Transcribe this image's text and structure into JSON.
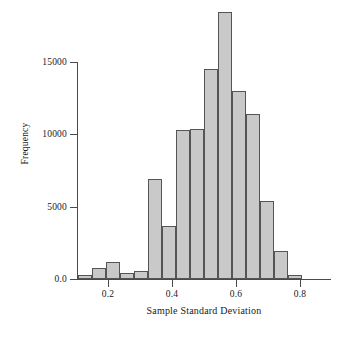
{
  "chart_data": {
    "type": "bar",
    "subtype": "histogram",
    "title": "",
    "xlabel": "Sample Standard Deviation",
    "ylabel": "Frequency",
    "xlim": [
      0.105,
      0.895
    ],
    "ylim": [
      0,
      18700
    ],
    "grid": false,
    "legend": null,
    "bin_width": 0.0439,
    "bar_fill_color": "#c9c9c9",
    "bar_edge_color": "#555555",
    "axis_color": "#4a4a4a",
    "x_ticks": [
      {
        "value": 0.2,
        "label": "0.2"
      },
      {
        "value": 0.4,
        "label": "0.4"
      },
      {
        "value": 0.6,
        "label": "0.6"
      },
      {
        "value": 0.8,
        "label": "0.8"
      }
    ],
    "y_ticks": [
      {
        "value": 0,
        "label": "0.0"
      },
      {
        "value": 5000,
        "label": "5000"
      },
      {
        "value": 10000,
        "label": "10000"
      },
      {
        "value": 15000,
        "label": "15000"
      }
    ],
    "bins": [
      {
        "x_left": 0.105,
        "x_right": 0.1489,
        "center": 0.127,
        "value": 300
      },
      {
        "x_left": 0.1489,
        "x_right": 0.1928,
        "center": 0.171,
        "value": 750
      },
      {
        "x_left": 0.1928,
        "x_right": 0.2367,
        "center": 0.215,
        "value": 1150
      },
      {
        "x_left": 0.2367,
        "x_right": 0.2806,
        "center": 0.259,
        "value": 400
      },
      {
        "x_left": 0.2806,
        "x_right": 0.3244,
        "center": 0.303,
        "value": 550
      },
      {
        "x_left": 0.3244,
        "x_right": 0.3683,
        "center": 0.346,
        "value": 6900
      },
      {
        "x_left": 0.3683,
        "x_right": 0.4122,
        "center": 0.39,
        "value": 3650
      },
      {
        "x_left": 0.4122,
        "x_right": 0.4561,
        "center": 0.434,
        "value": 10250
      },
      {
        "x_left": 0.4561,
        "x_right": 0.5,
        "center": 0.478,
        "value": 10350
      },
      {
        "x_left": 0.5,
        "x_right": 0.5439,
        "center": 0.522,
        "value": 14500
      },
      {
        "x_left": 0.5439,
        "x_right": 0.5878,
        "center": 0.566,
        "value": 18400
      },
      {
        "x_left": 0.5878,
        "x_right": 0.6317,
        "center": 0.61,
        "value": 13000
      },
      {
        "x_left": 0.6317,
        "x_right": 0.6756,
        "center": 0.654,
        "value": 11400
      },
      {
        "x_left": 0.6756,
        "x_right": 0.7194,
        "center": 0.697,
        "value": 5400
      },
      {
        "x_left": 0.7194,
        "x_right": 0.7633,
        "center": 0.741,
        "value": 1950
      },
      {
        "x_left": 0.7633,
        "x_right": 0.8072,
        "center": 0.785,
        "value": 300
      }
    ]
  }
}
